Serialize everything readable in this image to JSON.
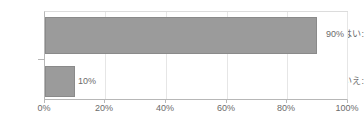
{
  "chart_data": {
    "type": "bar",
    "orientation": "horizontal",
    "title": "",
    "xlabel": "",
    "ylabel": "",
    "categories": [
      "はい:",
      "いいえ:"
    ],
    "values": [
      90,
      10
    ],
    "value_labels": [
      "90%",
      "10%"
    ],
    "xlim": [
      0,
      100
    ],
    "xticks": [
      0,
      20,
      40,
      60,
      80,
      100
    ],
    "xtick_labels": [
      "0%",
      "20%",
      "40%",
      "60%",
      "80%",
      "100%"
    ],
    "grid": true,
    "grid_axis": "x",
    "legend": false,
    "series": [
      {
        "name": "",
        "values": [
          90,
          10
        ]
      }
    ],
    "colors": {
      "bar_fill": "#9b9b9b",
      "bar_border": "#8a8a8a",
      "gridline": "#e6e6e6",
      "axis": "#b7b7b7",
      "text": "#6b6b6b",
      "background": "#ffffff"
    }
  }
}
